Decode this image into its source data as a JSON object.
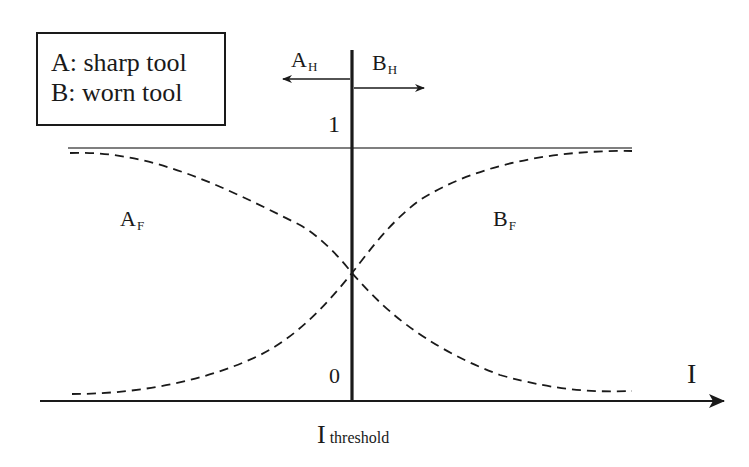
{
  "diagram": {
    "legend": {
      "items": [
        {
          "key": "A",
          "label": "A: sharp tool"
        },
        {
          "key": "B",
          "label": "B: worn tool"
        }
      ]
    },
    "arrows": {
      "a_h": {
        "main": "A",
        "sub": "H",
        "direction": "left"
      },
      "b_h": {
        "main": "B",
        "sub": "H",
        "direction": "right"
      }
    },
    "curves": {
      "a_f": {
        "main": "A",
        "sub": "F",
        "style": "dashed",
        "trend": "decreasing"
      },
      "b_f": {
        "main": "B",
        "sub": "F",
        "style": "dashed",
        "trend": "increasing"
      }
    },
    "y_ticks": {
      "top": "1",
      "bottom": "0"
    },
    "x_axis": {
      "label": "I",
      "threshold_main": "I",
      "threshold_sub": "threshold"
    },
    "colors": {
      "ink": "#1a1a1a",
      "reference_line": "#555555",
      "background": "#ffffff"
    }
  }
}
